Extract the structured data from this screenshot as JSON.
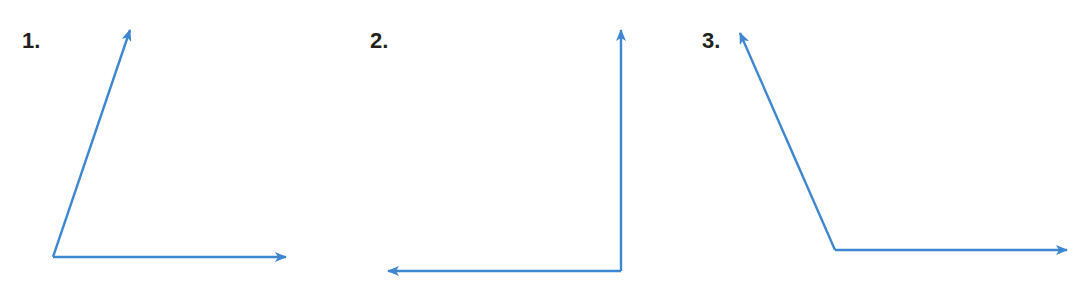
{
  "stroke_color": "#3f86d0",
  "figures": [
    {
      "label": "1.",
      "vertex": [
        53,
        257
      ],
      "rays": [
        [
          130,
          28
        ],
        [
          287,
          257
        ]
      ]
    },
    {
      "label": "2.",
      "vertex": [
        621,
        271
      ],
      "rays": [
        [
          621,
          30
        ],
        [
          387,
          271
        ]
      ]
    },
    {
      "label": "3.",
      "vertex": [
        835,
        250
      ],
      "rays": [
        [
          740,
          32
        ],
        [
          1068,
          250
        ]
      ]
    }
  ]
}
